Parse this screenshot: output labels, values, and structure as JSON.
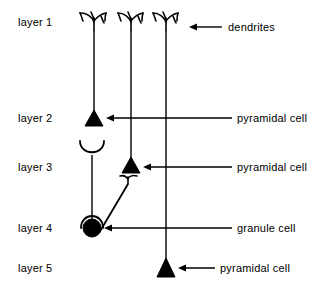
{
  "diagram": {
    "stroke_color": "#000000",
    "background_color": "#ffffff",
    "layer_labels": [
      {
        "id": "layer-1",
        "text": "layer 1",
        "x": 18,
        "y": 22
      },
      {
        "id": "layer-2",
        "text": "layer 2",
        "x": 18,
        "y": 113
      },
      {
        "id": "layer-3",
        "text": "layer 3",
        "x": 18,
        "y": 163
      },
      {
        "id": "layer-4",
        "text": "layer 4",
        "x": 18,
        "y": 222
      },
      {
        "id": "layer-5",
        "text": "layer 5",
        "x": 18,
        "y": 262
      }
    ],
    "callout_labels": [
      {
        "id": "dendrites",
        "text": "dendrites",
        "x": 228,
        "y": 22
      },
      {
        "id": "pyramidal-cell-layer-2",
        "text": "pyramidal  cell",
        "x": 237,
        "y": 113
      },
      {
        "id": "pyramidal-cell-layer-3",
        "text": "pyramidal  cell",
        "x": 237,
        "y": 163
      },
      {
        "id": "granule-cell-layer-4",
        "text": "granule  cell",
        "x": 237,
        "y": 222
      },
      {
        "id": "pyramidal-cell-layer-5",
        "text": "pyramidal  cell",
        "x": 220,
        "y": 262
      }
    ],
    "arrows": [
      {
        "id": "arrow-dendrites",
        "from_x": 222,
        "to_x": 189,
        "y": 27
      },
      {
        "id": "arrow-pyramidal-2",
        "from_x": 232,
        "to_x": 106,
        "y": 118
      },
      {
        "id": "arrow-pyramidal-3",
        "from_x": 232,
        "to_x": 143,
        "y": 167
      },
      {
        "id": "arrow-granule-4",
        "from_x": 232,
        "to_x": 104,
        "y": 228
      },
      {
        "id": "arrow-pyramidal-5",
        "from_x": 215,
        "to_x": 178,
        "y": 268
      }
    ],
    "cells": [
      {
        "id": "pyramidal-cell-1",
        "type": "pyramidal",
        "soma_label": "pyramidal cell soma",
        "soma_x": 94,
        "soma_y": 118,
        "soma_half_width": 9,
        "soma_height": 16,
        "apical_top_y": 30,
        "dendrite_tuft_y": 14
      },
      {
        "id": "pyramidal-cell-2",
        "type": "pyramidal",
        "soma_label": "pyramidal cell soma",
        "soma_x": 131,
        "soma_y": 165,
        "soma_half_width": 9,
        "soma_height": 16,
        "apical_top_y": 30,
        "dendrite_tuft_y": 14
      },
      {
        "id": "pyramidal-cell-3",
        "type": "pyramidal",
        "soma_label": "pyramidal cell soma",
        "soma_x": 166,
        "soma_y": 268,
        "soma_half_width": 9,
        "soma_height": 18,
        "apical_top_y": 30,
        "dendrite_tuft_y": 14
      },
      {
        "id": "granule-cell-1",
        "type": "granule",
        "soma_label": "granule cell soma",
        "soma_x": 92,
        "soma_y": 228,
        "soma_radius": 9,
        "dendrite_top_y": 141,
        "axon_terminal_x": 128,
        "axon_terminal_y": 182
      }
    ]
  }
}
